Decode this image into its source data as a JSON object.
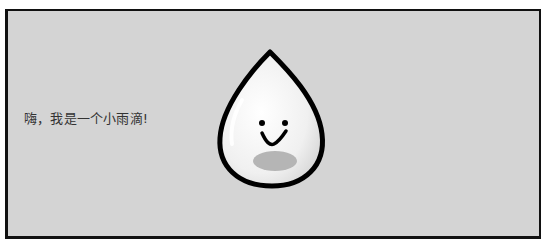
{
  "scene": {
    "caption": "嗨，我是一个小雨滴!",
    "character": "raindrop-with-smiley-face",
    "colors": {
      "background": "#d4d4d4",
      "frame": "#111111",
      "drop_fill": "#f2f2f2",
      "drop_outline": "#000000",
      "shadow": "#b5b5b5",
      "text": "#333333"
    }
  }
}
